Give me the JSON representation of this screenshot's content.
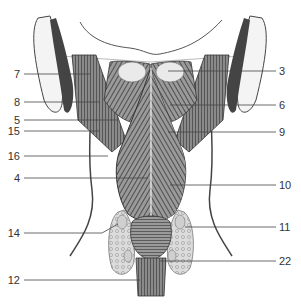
{
  "figure": {
    "labels_left": [
      {
        "num": "7",
        "y": 74,
        "x_end": 90
      },
      {
        "num": "8",
        "y": 102,
        "x_end": 100
      },
      {
        "num": "5",
        "y": 120,
        "x_end": 118
      },
      {
        "num": "15",
        "y": 131,
        "x_end": 100
      },
      {
        "num": "16",
        "y": 156,
        "x_end": 108
      },
      {
        "num": "4",
        "y": 178,
        "x_end": 148
      },
      {
        "num": "14",
        "y": 233,
        "x_end": 110
      },
      {
        "num": "12",
        "y": 280,
        "x_end": 140
      }
    ],
    "labels_right": [
      {
        "num": "3",
        "y": 71,
        "x_start": 168
      },
      {
        "num": "6",
        "y": 105,
        "x_start": 170
      },
      {
        "num": "9",
        "y": 132,
        "x_start": 168
      },
      {
        "num": "10",
        "y": 185,
        "x_start": 170
      },
      {
        "num": "11",
        "y": 227,
        "x_start": 185
      },
      {
        "num": "22",
        "y": 261,
        "x_start": 160
      }
    ],
    "colors": {
      "line": "#444444",
      "ink": "#222222",
      "shade": "#6a6a6a",
      "light": "#bdbdbd",
      "gland": "#d8d8d8"
    }
  }
}
